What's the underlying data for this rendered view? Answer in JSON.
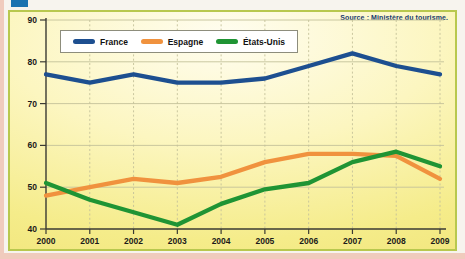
{
  "page": {
    "background_color": "#f7f4ee",
    "edge_color": "#f0cbbd",
    "tab_marker_color": "#1a72b0"
  },
  "panel": {
    "border_color": "#b8c84e",
    "background_center": "#fffdf0",
    "background_edge": "#efe274"
  },
  "chart_data": {
    "type": "line",
    "title": "",
    "source": "Source : Ministère du tourisme.",
    "x": [
      2000,
      2001,
      2002,
      2003,
      2004,
      2005,
      2006,
      2007,
      2008,
      2009
    ],
    "xlabel": "",
    "ylabel": "",
    "ylim": [
      40,
      90
    ],
    "yticks": [
      40,
      50,
      60,
      70,
      80,
      90
    ],
    "grid": {
      "horizontal": "solid",
      "vertical": "dashed"
    },
    "legend_position": "top",
    "series": [
      {
        "name": "France",
        "color": "#1d4f90",
        "values": [
          77,
          75,
          77,
          75,
          75,
          76,
          79,
          82,
          79,
          77
        ]
      },
      {
        "name": "Espagne",
        "color": "#f0923e",
        "values": [
          48,
          50,
          52,
          51,
          52.5,
          56,
          58,
          58,
          57.5,
          52
        ]
      },
      {
        "name": "États-Unis",
        "color": "#1f9434",
        "values": [
          51,
          47,
          44,
          41,
          46,
          49.5,
          51,
          56,
          58.5,
          55
        ]
      }
    ],
    "axis_color": "#3a3a33",
    "gridline_color": "#c4c29a"
  }
}
